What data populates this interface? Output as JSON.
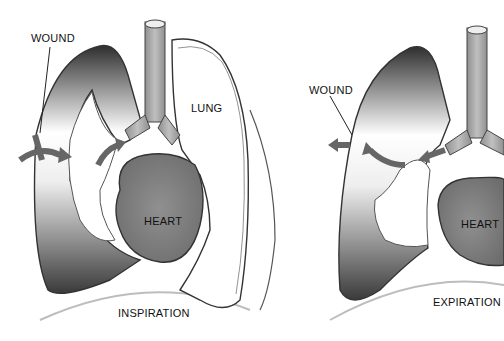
{
  "diagram": {
    "panels": [
      {
        "id": "inspiration",
        "caption": "INSPIRATION",
        "labels": {
          "wound": "WOUND",
          "lung": "LUNG",
          "heart": "HEART"
        }
      },
      {
        "id": "expiration",
        "caption": "EXPIRATION",
        "labels": {
          "wound": "WOUND",
          "heart": "HEART"
        }
      }
    ],
    "colors": {
      "outline": "#333333",
      "trachea": "#a8a8a8",
      "heart": "#8a8a8a",
      "arrow": "#666666",
      "shading_dark": "#3a3a3a"
    }
  }
}
